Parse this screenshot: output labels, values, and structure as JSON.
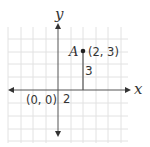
{
  "diagram": {
    "type": "coordinate-plane",
    "axes": {
      "x_label": "x",
      "y_label": "y"
    },
    "origin_label": "(0, 0)",
    "point": {
      "name": "A",
      "coords_label": "(2, 3)",
      "x": 2,
      "y": 3
    },
    "horizontal_distance_label": "2",
    "vertical_distance_label": "3",
    "colors": {
      "axis": "#444444",
      "grid": "#dddddd",
      "point": "#222222"
    }
  }
}
